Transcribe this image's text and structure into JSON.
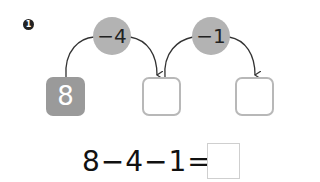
{
  "problem": {
    "number": "1",
    "start_value": "8",
    "steps": [
      {
        "operator_label": "−4"
      },
      {
        "operator_label": "−1"
      }
    ],
    "answer_boxes": [
      "",
      ""
    ],
    "equation": {
      "text": "8−4−1=",
      "answer": ""
    }
  },
  "colors": {
    "operator_circle": "#b3b3b3",
    "start_box": "#9a9a9a",
    "empty_box_border": "#b8b8b8"
  }
}
